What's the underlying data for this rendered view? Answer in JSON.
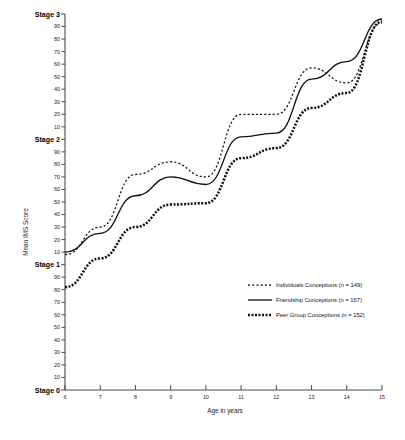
{
  "chart_data": {
    "type": "line",
    "title": "",
    "xlabel": "Age in years",
    "ylabel": "Mean IMS Score",
    "x": [
      6,
      7,
      8,
      9,
      10,
      11,
      12,
      13,
      14,
      15
    ],
    "xlim": [
      6,
      15
    ],
    "ylim": [
      0,
      300
    ],
    "grid": false,
    "legend_position": "center-right",
    "y_axis_note": "Stage scale: Stage 0 = 0, Stage 1 = 100, Stage 2 = 200, Stage 3 = 300; intermediate ticks 10-90 within each stage",
    "y_stage_labels": [
      "Stage 0",
      "Stage 1",
      "Stage 2",
      "Stage 3"
    ],
    "y_stage_values": [
      0,
      100,
      200,
      300
    ],
    "y_minor_tick_labels": [
      "10",
      "20",
      "30",
      "40",
      "50",
      "60",
      "70",
      "80",
      "90"
    ],
    "xticklabels": [
      "6",
      "7",
      "8",
      "9",
      "10",
      "11",
      "12",
      "13",
      "14",
      "15"
    ],
    "series": [
      {
        "name": "Individuals Conceptions",
        "n": 149,
        "legend_label": "Individuals Conceptions  (n = 149)",
        "style": "dotted",
        "values": [
          108,
          130,
          172,
          182,
          170,
          220,
          220,
          257,
          245,
          293
        ]
      },
      {
        "name": "Friendship Conceptions",
        "n": 157,
        "legend_label": "Friendship Conceptions  (n = 157)",
        "style": "solid",
        "values": [
          110,
          125,
          155,
          170,
          164,
          202,
          205,
          248,
          262,
          296
        ]
      },
      {
        "name": "Peer Group Conceptions",
        "n": 152,
        "legend_label": "Peer Group Conceptions (n = 152)",
        "style": "thick-dotted",
        "values": [
          82,
          105,
          130,
          148,
          149,
          185,
          193,
          225,
          237,
          294
        ]
      }
    ]
  },
  "colors": {
    "ink": "#111111",
    "axis": "#4a4a4a",
    "background": "#ffffff"
  }
}
